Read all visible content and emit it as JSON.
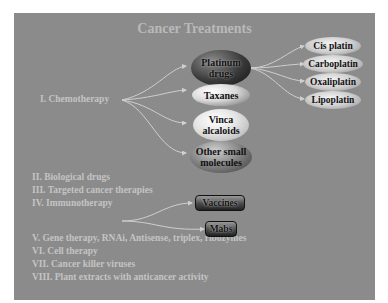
{
  "title": "Cancer Treatments",
  "categories": [
    {
      "label": "I. Chemotherapy"
    },
    {
      "label": "II. Biological drugs"
    },
    {
      "label": "III. Targeted cancer therapies"
    },
    {
      "label": "IV. Immunotherapy"
    },
    {
      "label": "V. Gene therapy, RNAi, Antisense, triplex, ribozymes"
    },
    {
      "label": "VI. Cell therapy"
    },
    {
      "label": "VII. Cancer killer viruses"
    },
    {
      "label": "VIII. Plant extracts with anticancer activity"
    }
  ],
  "chemotherapy_nodes": [
    {
      "line1": "Platinum",
      "line2": "drugs"
    },
    {
      "line1": "Taxanes",
      "line2": ""
    },
    {
      "line1": "Vinca",
      "line2": "alcaloids"
    },
    {
      "line1": "Other small",
      "line2": "molecules"
    }
  ],
  "platinum_nodes": [
    {
      "label": "Cis platin"
    },
    {
      "label": "Carboplatin"
    },
    {
      "label": "Oxaliplatin"
    },
    {
      "label": "Lipoplatin"
    }
  ],
  "immunotherapy_nodes": [
    {
      "label": "Vaccines"
    },
    {
      "label": "Mabs"
    }
  ],
  "colors": {
    "slide_background": "#8b8b8b",
    "text": "#c4c4c4",
    "arrow": "#c8c8c8"
  }
}
